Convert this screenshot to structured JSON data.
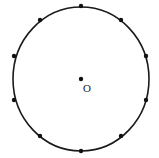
{
  "diagram": {
    "type": "circle-with-points",
    "center": {
      "x": 81,
      "y": 79,
      "label": "O"
    },
    "circle": {
      "cx": 81,
      "cy": 79,
      "rx": 68,
      "ry": 72,
      "stroke": "#1a1a1a",
      "stroke_width": 1.6
    },
    "point_color": "#111111",
    "point_radius": 2.2,
    "points": [
      {
        "x": 81,
        "y": 6
      },
      {
        "x": 121,
        "y": 20
      },
      {
        "x": 146,
        "y": 56
      },
      {
        "x": 146,
        "y": 100
      },
      {
        "x": 121,
        "y": 136
      },
      {
        "x": 81,
        "y": 151
      },
      {
        "x": 40,
        "y": 136
      },
      {
        "x": 14,
        "y": 100
      },
      {
        "x": 14,
        "y": 56
      },
      {
        "x": 40,
        "y": 20
      }
    ],
    "center_label_pos": {
      "x": 83,
      "y": 92
    }
  }
}
